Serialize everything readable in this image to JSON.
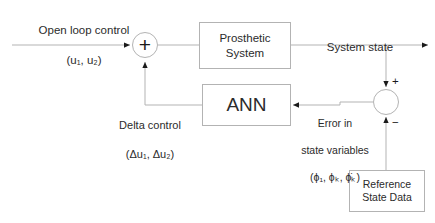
{
  "diagram": {
    "colors": {
      "line": "#b3b3b3",
      "text": "#2b2b2b",
      "background": "#ffffff",
      "arrow": "#1a1a1a"
    },
    "blocks": {
      "prosthetic": {
        "line1": "Prosthetic",
        "line2": "System"
      },
      "ann": {
        "label": "ANN"
      },
      "reference": {
        "line1": "Reference",
        "line2": "State Data"
      }
    },
    "junctions": {
      "summing": {
        "symbol": "+",
        "name": "summing-junction"
      },
      "error": {
        "plus": "+",
        "minus": "−",
        "name": "error-junction"
      }
    },
    "labels": {
      "open_loop": {
        "line1": "Open loop control",
        "line2": "(u₁, u₂)"
      },
      "system_state": {
        "text": "System state"
      },
      "delta_control": {
        "line1": "Delta control",
        "line2": "(Δu₁, Δu₂)"
      },
      "error_state": {
        "line1": "Error in",
        "line2": "state variables",
        "line3": "(ϕ₁, ϕₖ, ϕ̇ₖ)"
      }
    }
  }
}
